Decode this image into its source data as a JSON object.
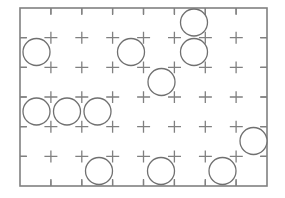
{
  "canvas": {
    "width": 285,
    "height": 198,
    "background": "#ffffff"
  },
  "diagram": {
    "frame": {
      "x": 20,
      "y": 8,
      "width": 247,
      "height": 178,
      "stroke": "#808080",
      "stroke_width": 1.6
    },
    "grid": {
      "columns": 8,
      "rows": 6,
      "cell_width": 30.9,
      "cell_height": 29.7,
      "stroke": "#808080",
      "stroke_width": 1.3,
      "dash_pattern": "12 10",
      "style": "dashed-cross-hatch",
      "vertical_lines_x": [
        50.9,
        81.8,
        112.6,
        143.5,
        174.4,
        205.3,
        236.1
      ],
      "horizontal_lines_y": [
        37.7,
        67.3,
        97.0,
        126.7,
        156.3
      ]
    },
    "circles": {
      "radius": 13.5,
      "stroke": "#707070",
      "stroke_width": 1.3,
      "fill": "none",
      "count": 12,
      "items": [
        {
          "id": "circle-1",
          "cx": 194.0,
          "cy": 22.5,
          "col": 5,
          "row": 0
        },
        {
          "id": "circle-2",
          "cx": 36.5,
          "cy": 52.0,
          "col": 0,
          "row": 1
        },
        {
          "id": "circle-3",
          "cx": 131.0,
          "cy": 52.0,
          "col": 3,
          "row": 1
        },
        {
          "id": "circle-4",
          "cx": 194.0,
          "cy": 52.0,
          "col": 5,
          "row": 1
        },
        {
          "id": "circle-5",
          "cx": 161.5,
          "cy": 82.0,
          "col": 4,
          "row": 2
        },
        {
          "id": "circle-6",
          "cx": 36.5,
          "cy": 111.5,
          "col": 0,
          "row": 3
        },
        {
          "id": "circle-7",
          "cx": 67.0,
          "cy": 111.5,
          "col": 1,
          "row": 3
        },
        {
          "id": "circle-8",
          "cx": 97.5,
          "cy": 111.5,
          "col": 2,
          "row": 3
        },
        {
          "id": "circle-9",
          "cx": 253.5,
          "cy": 141.0,
          "col": 7,
          "row": 4
        },
        {
          "id": "circle-10",
          "cx": 99.0,
          "cy": 171.0,
          "col": 2,
          "row": 5
        },
        {
          "id": "circle-11",
          "cx": 161.0,
          "cy": 171.0,
          "col": 4,
          "row": 5
        },
        {
          "id": "circle-12",
          "cx": 222.5,
          "cy": 171.0,
          "col": 6,
          "row": 5
        }
      ]
    }
  }
}
